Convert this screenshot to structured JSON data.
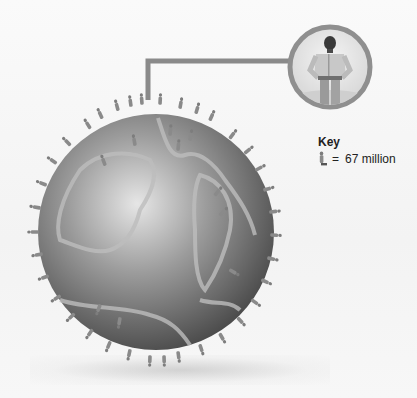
{
  "figure": {
    "colors": {
      "globe_light": "#d8d8d8",
      "globe_dark": "#555555",
      "continent_outline": "#b5b5b5",
      "figure": "#7a7a7a",
      "connector": "#8a8a8a",
      "inset_ring": "#8f8f8f"
    }
  },
  "inset": {
    "subject": "person-standing-hands-on-hips"
  },
  "key": {
    "title": "Key",
    "icon": "person-icon",
    "equals": "=",
    "value": "67 million"
  }
}
